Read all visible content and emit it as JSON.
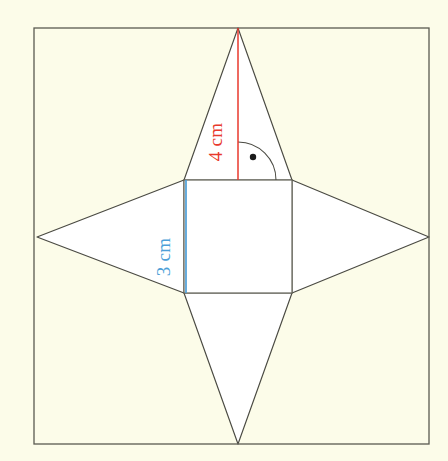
{
  "diagram": {
    "background_color": "#fcfce9",
    "interior_fill": "#ffffff",
    "outline_color": "#4a4a42",
    "border": {
      "name": "outer-frame",
      "x": 34,
      "y": 28,
      "width": 395,
      "height": 416,
      "stroke": "#5a5a50"
    },
    "base_square": {
      "label": "base square",
      "x": 184,
      "y": 180,
      "width": 108,
      "height": 113,
      "stroke": "#6b6b60",
      "fill": "#ffffff"
    },
    "apex_points": {
      "top": {
        "x": 238,
        "y": 28
      },
      "bottom": {
        "x": 238,
        "y": 444
      },
      "left": {
        "x": 37,
        "y": 237
      },
      "right": {
        "x": 429,
        "y": 237
      }
    },
    "triangles": [
      {
        "name": "triangle-top",
        "points": "184,180 238,28 292,180"
      },
      {
        "name": "triangle-bottom",
        "points": "184,293 238,444 292,293"
      },
      {
        "name": "triangle-left",
        "points": "184,180 37,237 184,293"
      },
      {
        "name": "triangle-right",
        "points": "292,180 429,237 292,293"
      }
    ],
    "measurements": [
      {
        "id": "slant-height",
        "value": "4 cm",
        "color": "#e8392c",
        "orientation": "vertical",
        "line": {
          "x1": 238,
          "y1": 28,
          "x2": 238,
          "y2": 180
        },
        "label_position": {
          "x": 222,
          "y": 142
        }
      },
      {
        "id": "base-edge",
        "value": "3 cm",
        "color": "#4d9fd8",
        "orientation": "vertical",
        "line": {
          "x1": 186,
          "y1": 180,
          "x2": 186,
          "y2": 293
        },
        "label_position": {
          "x": 170,
          "y": 257
        }
      }
    ],
    "right_angle_marker": {
      "name": "right-angle-marker",
      "vertex": {
        "x": 238,
        "y": 180
      },
      "arc_radius": 38,
      "dot": {
        "x": 253,
        "y": 157,
        "r": 3.2
      },
      "stroke": "#4a4a42"
    }
  }
}
